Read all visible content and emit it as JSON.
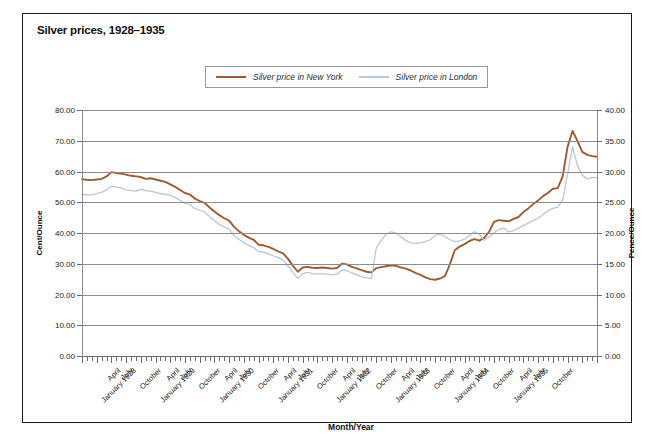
{
  "title": "Silver prices, 1928–1935",
  "legend": {
    "items": [
      {
        "label": "Silver price in New York",
        "color": "#9c5b33"
      },
      {
        "label": "Silver price in London",
        "color": "#b9c8d8"
      }
    ]
  },
  "axes": {
    "left_title": "Cent/Ounce",
    "right_title": "Pence/Ounce",
    "x_title": "Month/Year",
    "left_ticks": [
      "0.00",
      "10.00",
      "20.00",
      "30.00",
      "40.00",
      "50.00",
      "60.00",
      "70.00",
      "80.00"
    ],
    "right_ticks": [
      "0.00",
      "5.00",
      "10.00",
      "15.00",
      "20.00",
      "25.00",
      "30.00",
      "35.00",
      "40.00"
    ]
  },
  "chart_data": {
    "type": "line",
    "title": "Silver prices, 1928–1935",
    "xlabel": "Month/Year",
    "ylabel": "Cent/Ounce",
    "y2label": "Pence/Ounce",
    "ylim": [
      0,
      80
    ],
    "y2lim": [
      0,
      40
    ],
    "ytick_step": 10,
    "y2tick_step": 5,
    "grid": true,
    "legend_position": "top-center",
    "x_tick_labels": [
      "January 1928",
      "April",
      "July",
      "October",
      "January 1929",
      "April",
      "July",
      "October",
      "January 1930",
      "April",
      "July",
      "October",
      "January 1931",
      "April",
      "July",
      "October",
      "January 1932",
      "April",
      "July",
      "October",
      "January 1933",
      "April",
      "July",
      "October",
      "January 1934",
      "April",
      "July",
      "October",
      "January 1935",
      "April",
      "July",
      "October"
    ],
    "x_tick_label_interval": 3,
    "x_minor_ticks": 94,
    "x_range": [
      "January 1928",
      "October 1935"
    ],
    "series": [
      {
        "name": "Silver price in New York",
        "unit": "Cent/Ounce",
        "axis": "left",
        "color": "#9c5b33",
        "values": [
          57.5,
          57.3,
          57.2,
          57.4,
          57.6,
          58.4,
          59.8,
          59.5,
          59.3,
          59.0,
          58.6,
          58.4,
          58.2,
          57.6,
          57.8,
          57.4,
          57.0,
          56.6,
          55.8,
          55.0,
          54.0,
          53.0,
          52.5,
          51.2,
          50.4,
          49.8,
          48.3,
          47.0,
          45.8,
          44.8,
          44.0,
          42.0,
          40.6,
          39.4,
          38.5,
          37.8,
          36.2,
          36.0,
          35.5,
          34.8,
          34.0,
          33.4,
          31.6,
          29.4,
          27.4,
          28.8,
          29.0,
          28.7,
          28.6,
          28.8,
          28.6,
          28.4,
          28.6,
          30.0,
          29.8,
          29.0,
          28.5,
          27.9,
          27.4,
          27.2,
          28.6,
          28.9,
          29.2,
          29.5,
          29.3,
          28.8,
          28.4,
          27.8,
          27.0,
          26.4,
          25.6,
          25.0,
          24.8,
          25.2,
          26.0,
          29.8,
          34.4,
          35.6,
          36.4,
          37.4,
          38.0,
          37.5,
          38.4,
          40.4,
          43.6,
          44.2,
          44.0,
          43.8,
          44.6,
          45.2,
          46.8,
          48.0,
          49.4,
          50.6,
          52.0,
          53.0,
          54.4,
          54.6,
          58.4,
          68.0,
          73.2,
          70.0,
          66.4,
          65.4,
          65.0,
          64.8
        ]
      },
      {
        "name": "Silver price in London",
        "unit": "Pence/Ounce",
        "axis": "right",
        "color": "#b9c8d8",
        "values": [
          26.3,
          26.2,
          26.2,
          26.4,
          26.6,
          27.0,
          27.6,
          27.5,
          27.3,
          27.0,
          26.9,
          26.8,
          27.1,
          26.9,
          26.8,
          26.6,
          26.4,
          26.3,
          26.1,
          25.8,
          25.3,
          24.8,
          24.6,
          24.0,
          23.7,
          23.4,
          22.7,
          22.0,
          21.4,
          21.0,
          20.6,
          19.6,
          19.0,
          18.4,
          18.0,
          17.6,
          17.0,
          16.9,
          16.6,
          16.3,
          16.0,
          15.6,
          14.6,
          13.6,
          12.6,
          13.4,
          13.6,
          13.4,
          13.3,
          13.4,
          13.3,
          13.2,
          13.3,
          14.0,
          13.9,
          13.5,
          13.2,
          12.9,
          12.7,
          12.6,
          17.6,
          18.8,
          19.8,
          20.2,
          20.0,
          19.4,
          18.8,
          18.4,
          18.3,
          18.4,
          18.6,
          18.9,
          19.6,
          19.8,
          19.4,
          18.9,
          18.6,
          18.7,
          19.0,
          19.6,
          20.2,
          19.8,
          18.8,
          19.4,
          20.0,
          20.6,
          20.8,
          20.2,
          20.4,
          20.8,
          21.2,
          21.6,
          22.0,
          22.4,
          23.0,
          23.6,
          24.0,
          24.2,
          25.4,
          29.6,
          34.0,
          31.0,
          29.4,
          28.8,
          29.0,
          29.0
        ]
      }
    ]
  }
}
